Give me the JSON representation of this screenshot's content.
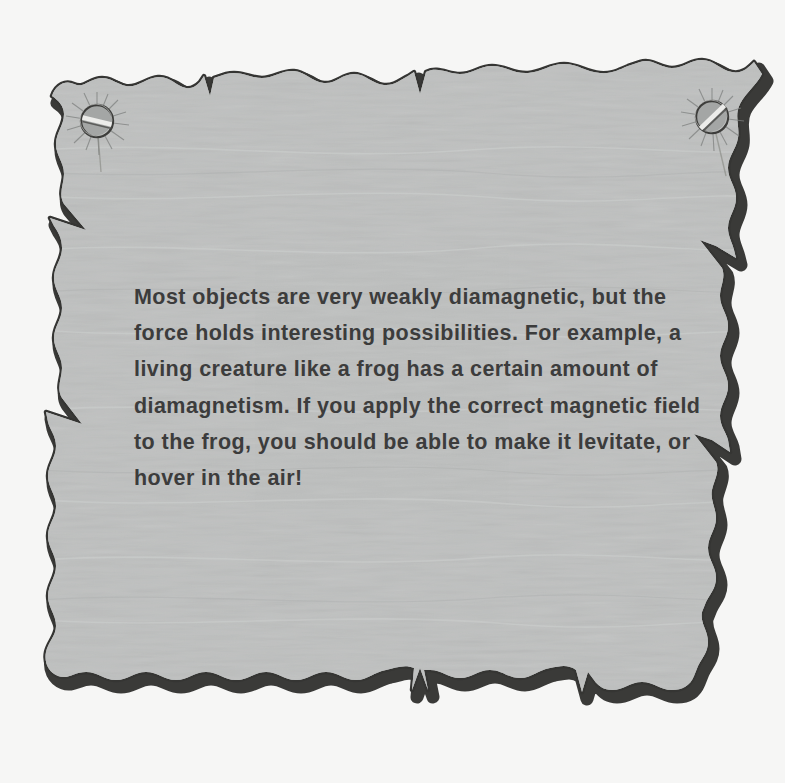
{
  "page": {
    "background_color": "#f6f6f5",
    "width": 785,
    "height": 783
  },
  "paper": {
    "name": "torn-paper-sheet",
    "fill_color": "#b9bbba",
    "edge_shadow_color": "#3a3a38",
    "texture": "fibrous horizontal streaks"
  },
  "note": {
    "body": "Most objects are very weakly diamagnetic, but the force holds interesting possibilities. For example, a living creature like a frog has a certain amount of diamagnetism. If you apply the correct magnetic field to the frog, you should be able to make it levitate, or hover in the air!",
    "text_color": "#3c3c3c",
    "lines": [
      "Most objects are very weakly diamagnetic, but the",
      "force holds interesting possibilities. For example, a",
      "living creature like a frog has a certain amount of",
      "diamagnetism. If you apply the correct magnetic field",
      "to the frog, you should be able to make it levitate, or",
      "hover in the air!"
    ]
  },
  "fasteners": [
    {
      "name": "screw-top-left",
      "icon": "slotted-screw-icon",
      "x": 97,
      "y": 121,
      "radius": 16,
      "slot_angle_deg": 12,
      "color": "#9a9c9b"
    },
    {
      "name": "screw-top-right",
      "icon": "slotted-screw-icon",
      "x": 712,
      "y": 117,
      "radius": 16,
      "slot_angle_deg": -35,
      "color": "#9a9c9b"
    }
  ]
}
